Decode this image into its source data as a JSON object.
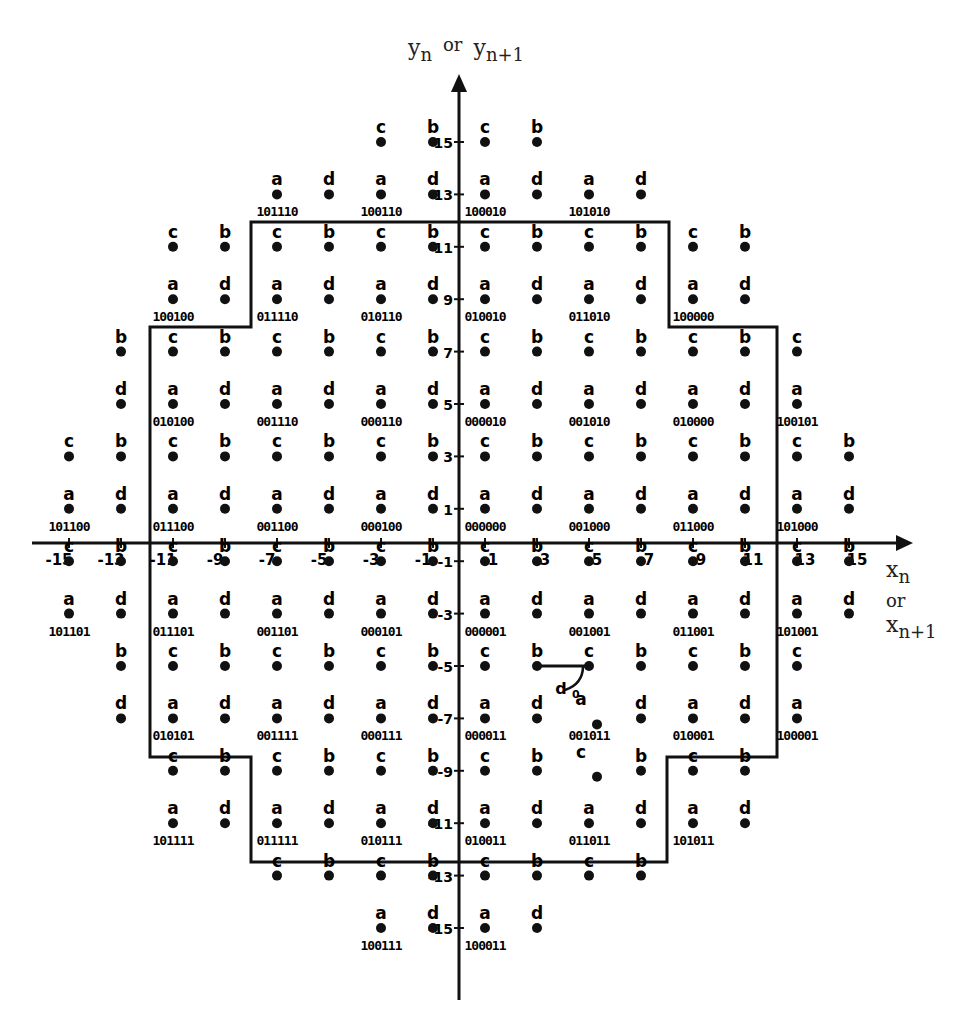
{
  "axes": {
    "y_title": {
      "base": "y",
      "sub": "n",
      "or": "or",
      "sub2": "n+1"
    },
    "x_title": {
      "base": "x",
      "sub": "n",
      "or": "or",
      "sub2": "n+1"
    },
    "x_ticks": [
      -15,
      -13,
      -11,
      -9,
      -7,
      -5,
      -3,
      -1,
      1,
      3,
      5,
      7,
      9,
      11,
      13,
      15
    ],
    "y_ticks": [
      15,
      13,
      11,
      9,
      7,
      5,
      3,
      1,
      -1,
      -3,
      -5,
      -7,
      -9,
      -11,
      -13,
      -15
    ]
  },
  "annotation": {
    "label": "d0",
    "from": [
      3,
      -5
    ],
    "to": [
      5,
      -5
    ]
  },
  "points": [
    {
      "x": -3,
      "y": 15,
      "s": "c"
    },
    {
      "x": -1,
      "y": 15,
      "s": "b"
    },
    {
      "x": 1,
      "y": 15,
      "s": "c"
    },
    {
      "x": 3,
      "y": 15,
      "s": "b"
    },
    {
      "x": -7,
      "y": 13,
      "s": "a",
      "code": "101110"
    },
    {
      "x": -5,
      "y": 13,
      "s": "d"
    },
    {
      "x": -3,
      "y": 13,
      "s": "a",
      "code": "100110"
    },
    {
      "x": -1,
      "y": 13,
      "s": "d"
    },
    {
      "x": 1,
      "y": 13,
      "s": "a",
      "code": "100010"
    },
    {
      "x": 3,
      "y": 13,
      "s": "d"
    },
    {
      "x": 5,
      "y": 13,
      "s": "a",
      "code": "101010"
    },
    {
      "x": 7,
      "y": 13,
      "s": "d"
    },
    {
      "x": -11,
      "y": 11,
      "s": "c"
    },
    {
      "x": -9,
      "y": 11,
      "s": "b"
    },
    {
      "x": -7,
      "y": 11,
      "s": "c"
    },
    {
      "x": -5,
      "y": 11,
      "s": "b"
    },
    {
      "x": -3,
      "y": 11,
      "s": "c"
    },
    {
      "x": -1,
      "y": 11,
      "s": "b"
    },
    {
      "x": 1,
      "y": 11,
      "s": "c"
    },
    {
      "x": 3,
      "y": 11,
      "s": "b"
    },
    {
      "x": 5,
      "y": 11,
      "s": "c"
    },
    {
      "x": 7,
      "y": 11,
      "s": "b"
    },
    {
      "x": 9,
      "y": 11,
      "s": "c"
    },
    {
      "x": 11,
      "y": 11,
      "s": "b"
    },
    {
      "x": -11,
      "y": 9,
      "s": "a",
      "code": "100100"
    },
    {
      "x": -9,
      "y": 9,
      "s": "d"
    },
    {
      "x": -7,
      "y": 9,
      "s": "a",
      "code": "011110"
    },
    {
      "x": -5,
      "y": 9,
      "s": "d"
    },
    {
      "x": -3,
      "y": 9,
      "s": "a",
      "code": "010110"
    },
    {
      "x": -1,
      "y": 9,
      "s": "d"
    },
    {
      "x": 1,
      "y": 9,
      "s": "a",
      "code": "010010"
    },
    {
      "x": 3,
      "y": 9,
      "s": "d"
    },
    {
      "x": 5,
      "y": 9,
      "s": "a",
      "code": "011010"
    },
    {
      "x": 7,
      "y": 9,
      "s": "d"
    },
    {
      "x": 9,
      "y": 9,
      "s": "a",
      "code": "100000"
    },
    {
      "x": 11,
      "y": 9,
      "s": "d"
    },
    {
      "x": -13,
      "y": 7,
      "s": "b"
    },
    {
      "x": -11,
      "y": 7,
      "s": "c"
    },
    {
      "x": -9,
      "y": 7,
      "s": "b"
    },
    {
      "x": -7,
      "y": 7,
      "s": "c"
    },
    {
      "x": -5,
      "y": 7,
      "s": "b"
    },
    {
      "x": -3,
      "y": 7,
      "s": "c"
    },
    {
      "x": -1,
      "y": 7,
      "s": "b"
    },
    {
      "x": 1,
      "y": 7,
      "s": "c"
    },
    {
      "x": 3,
      "y": 7,
      "s": "b"
    },
    {
      "x": 5,
      "y": 7,
      "s": "c"
    },
    {
      "x": 7,
      "y": 7,
      "s": "b"
    },
    {
      "x": 9,
      "y": 7,
      "s": "c"
    },
    {
      "x": 11,
      "y": 7,
      "s": "b"
    },
    {
      "x": 13,
      "y": 7,
      "s": "c"
    },
    {
      "x": -13,
      "y": 5,
      "s": "d"
    },
    {
      "x": -11,
      "y": 5,
      "s": "a",
      "code": "010100"
    },
    {
      "x": -9,
      "y": 5,
      "s": "d"
    },
    {
      "x": -7,
      "y": 5,
      "s": "a",
      "code": "001110"
    },
    {
      "x": -5,
      "y": 5,
      "s": "d"
    },
    {
      "x": -3,
      "y": 5,
      "s": "a",
      "code": "000110"
    },
    {
      "x": -1,
      "y": 5,
      "s": "d"
    },
    {
      "x": 1,
      "y": 5,
      "s": "a",
      "code": "000010"
    },
    {
      "x": 3,
      "y": 5,
      "s": "d"
    },
    {
      "x": 5,
      "y": 5,
      "s": "a",
      "code": "001010"
    },
    {
      "x": 7,
      "y": 5,
      "s": "d"
    },
    {
      "x": 9,
      "y": 5,
      "s": "a",
      "code": "010000"
    },
    {
      "x": 11,
      "y": 5,
      "s": "d"
    },
    {
      "x": 13,
      "y": 5,
      "s": "a",
      "code": "100101"
    },
    {
      "x": -15,
      "y": 3,
      "s": "c"
    },
    {
      "x": -13,
      "y": 3,
      "s": "b"
    },
    {
      "x": -11,
      "y": 3,
      "s": "c"
    },
    {
      "x": -9,
      "y": 3,
      "s": "b"
    },
    {
      "x": -7,
      "y": 3,
      "s": "c"
    },
    {
      "x": -5,
      "y": 3,
      "s": "b"
    },
    {
      "x": -3,
      "y": 3,
      "s": "c"
    },
    {
      "x": -1,
      "y": 3,
      "s": "b"
    },
    {
      "x": 1,
      "y": 3,
      "s": "c"
    },
    {
      "x": 3,
      "y": 3,
      "s": "b"
    },
    {
      "x": 5,
      "y": 3,
      "s": "c"
    },
    {
      "x": 7,
      "y": 3,
      "s": "b"
    },
    {
      "x": 9,
      "y": 3,
      "s": "c"
    },
    {
      "x": 11,
      "y": 3,
      "s": "b"
    },
    {
      "x": 13,
      "y": 3,
      "s": "c"
    },
    {
      "x": 15,
      "y": 3,
      "s": "b"
    },
    {
      "x": -15,
      "y": 1,
      "s": "a",
      "code": "101100"
    },
    {
      "x": -13,
      "y": 1,
      "s": "d"
    },
    {
      "x": -11,
      "y": 1,
      "s": "a",
      "code": "011100"
    },
    {
      "x": -9,
      "y": 1,
      "s": "d"
    },
    {
      "x": -7,
      "y": 1,
      "s": "a",
      "code": "001100"
    },
    {
      "x": -5,
      "y": 1,
      "s": "d"
    },
    {
      "x": -3,
      "y": 1,
      "s": "a",
      "code": "000100"
    },
    {
      "x": -1,
      "y": 1,
      "s": "d"
    },
    {
      "x": 1,
      "y": 1,
      "s": "a",
      "code": "000000"
    },
    {
      "x": 3,
      "y": 1,
      "s": "d"
    },
    {
      "x": 5,
      "y": 1,
      "s": "a",
      "code": "001000"
    },
    {
      "x": 7,
      "y": 1,
      "s": "d"
    },
    {
      "x": 9,
      "y": 1,
      "s": "a",
      "code": "011000"
    },
    {
      "x": 11,
      "y": 1,
      "s": "d"
    },
    {
      "x": 13,
      "y": 1,
      "s": "a",
      "code": "101000"
    },
    {
      "x": 15,
      "y": 1,
      "s": "d"
    },
    {
      "x": -15,
      "y": -1,
      "s": "c"
    },
    {
      "x": -13,
      "y": -1,
      "s": "b"
    },
    {
      "x": -11,
      "y": -1,
      "s": "c"
    },
    {
      "x": -9,
      "y": -1,
      "s": "b"
    },
    {
      "x": -7,
      "y": -1,
      "s": "c"
    },
    {
      "x": -5,
      "y": -1,
      "s": "b"
    },
    {
      "x": -3,
      "y": -1,
      "s": "c"
    },
    {
      "x": -1,
      "y": -1,
      "s": "b"
    },
    {
      "x": 1,
      "y": -1,
      "s": "c"
    },
    {
      "x": 3,
      "y": -1,
      "s": "b"
    },
    {
      "x": 5,
      "y": -1,
      "s": "c"
    },
    {
      "x": 7,
      "y": -1,
      "s": "b"
    },
    {
      "x": 9,
      "y": -1,
      "s": "c"
    },
    {
      "x": 11,
      "y": -1,
      "s": "b"
    },
    {
      "x": 13,
      "y": -1,
      "s": "c"
    },
    {
      "x": 15,
      "y": -1,
      "s": "b"
    },
    {
      "x": -15,
      "y": -3,
      "s": "a",
      "code": "101101"
    },
    {
      "x": -13,
      "y": -3,
      "s": "d"
    },
    {
      "x": -11,
      "y": -3,
      "s": "a",
      "code": "011101"
    },
    {
      "x": -9,
      "y": -3,
      "s": "d"
    },
    {
      "x": -7,
      "y": -3,
      "s": "a",
      "code": "001101"
    },
    {
      "x": -5,
      "y": -3,
      "s": "d"
    },
    {
      "x": -3,
      "y": -3,
      "s": "a",
      "code": "000101"
    },
    {
      "x": -1,
      "y": -3,
      "s": "d"
    },
    {
      "x": 1,
      "y": -3,
      "s": "a",
      "code": "000001"
    },
    {
      "x": 3,
      "y": -3,
      "s": "d"
    },
    {
      "x": 5,
      "y": -3,
      "s": "a",
      "code": "001001"
    },
    {
      "x": 7,
      "y": -3,
      "s": "d"
    },
    {
      "x": 9,
      "y": -3,
      "s": "a",
      "code": "011001"
    },
    {
      "x": 11,
      "y": -3,
      "s": "d"
    },
    {
      "x": 13,
      "y": -3,
      "s": "a",
      "code": "101001"
    },
    {
      "x": 15,
      "y": -3,
      "s": "d"
    },
    {
      "x": -13,
      "y": -5,
      "s": "b"
    },
    {
      "x": -11,
      "y": -5,
      "s": "c"
    },
    {
      "x": -9,
      "y": -5,
      "s": "b"
    },
    {
      "x": -7,
      "y": -5,
      "s": "c"
    },
    {
      "x": -5,
      "y": -5,
      "s": "b"
    },
    {
      "x": -3,
      "y": -5,
      "s": "c"
    },
    {
      "x": -1,
      "y": -5,
      "s": "b"
    },
    {
      "x": 1,
      "y": -5,
      "s": "c"
    },
    {
      "x": 3,
      "y": -5,
      "s": "b"
    },
    {
      "x": 5,
      "y": -5,
      "s": "c"
    },
    {
      "x": 7,
      "y": -5,
      "s": "b"
    },
    {
      "x": 9,
      "y": -5,
      "s": "c"
    },
    {
      "x": 11,
      "y": -5,
      "s": "b"
    },
    {
      "x": 13,
      "y": -5,
      "s": "c"
    },
    {
      "x": -13,
      "y": -7,
      "s": "d"
    },
    {
      "x": -11,
      "y": -7,
      "s": "a",
      "code": "010101"
    },
    {
      "x": -9,
      "y": -7,
      "s": "d"
    },
    {
      "x": -7,
      "y": -7,
      "s": "a",
      "code": "001111"
    },
    {
      "x": -5,
      "y": -7,
      "s": "d"
    },
    {
      "x": -3,
      "y": -7,
      "s": "a",
      "code": "000111"
    },
    {
      "x": -1,
      "y": -7,
      "s": "d"
    },
    {
      "x": 1,
      "y": -7,
      "s": "a",
      "code": "000011"
    },
    {
      "x": 3,
      "y": -7,
      "s": "d"
    },
    {
      "x": 5,
      "y": -7,
      "s": "a",
      "code": "001011",
      "offset": true
    },
    {
      "x": 7,
      "y": -7,
      "s": "d"
    },
    {
      "x": 9,
      "y": -7,
      "s": "a",
      "code": "010001"
    },
    {
      "x": 11,
      "y": -7,
      "s": "d"
    },
    {
      "x": 13,
      "y": -7,
      "s": "a",
      "code": "100001"
    },
    {
      "x": -11,
      "y": -9,
      "s": "c"
    },
    {
      "x": -9,
      "y": -9,
      "s": "b"
    },
    {
      "x": -7,
      "y": -9,
      "s": "c"
    },
    {
      "x": -5,
      "y": -9,
      "s": "b"
    },
    {
      "x": -3,
      "y": -9,
      "s": "c"
    },
    {
      "x": -1,
      "y": -9,
      "s": "b"
    },
    {
      "x": 1,
      "y": -9,
      "s": "c"
    },
    {
      "x": 3,
      "y": -9,
      "s": "b"
    },
    {
      "x": 5,
      "y": -9,
      "s": "c",
      "offset": true
    },
    {
      "x": 7,
      "y": -9,
      "s": "b"
    },
    {
      "x": 9,
      "y": -9,
      "s": "c"
    },
    {
      "x": 11,
      "y": -9,
      "s": "b"
    },
    {
      "x": -11,
      "y": -11,
      "s": "a",
      "code": "101111"
    },
    {
      "x": -9,
      "y": -11,
      "s": "d"
    },
    {
      "x": -7,
      "y": -11,
      "s": "a",
      "code": "011111"
    },
    {
      "x": -5,
      "y": -11,
      "s": "d"
    },
    {
      "x": -3,
      "y": -11,
      "s": "a",
      "code": "010111"
    },
    {
      "x": -1,
      "y": -11,
      "s": "d"
    },
    {
      "x": 1,
      "y": -11,
      "s": "a",
      "code": "010011"
    },
    {
      "x": 3,
      "y": -11,
      "s": "d"
    },
    {
      "x": 5,
      "y": -11,
      "s": "a",
      "code": "011011"
    },
    {
      "x": 7,
      "y": -11,
      "s": "d"
    },
    {
      "x": 9,
      "y": -11,
      "s": "a",
      "code": "101011"
    },
    {
      "x": 11,
      "y": -11,
      "s": "d"
    },
    {
      "x": -7,
      "y": -13,
      "s": "c"
    },
    {
      "x": -5,
      "y": -13,
      "s": "b"
    },
    {
      "x": -3,
      "y": -13,
      "s": "c"
    },
    {
      "x": -1,
      "y": -13,
      "s": "b"
    },
    {
      "x": 1,
      "y": -13,
      "s": "c"
    },
    {
      "x": 3,
      "y": -13,
      "s": "b"
    },
    {
      "x": 5,
      "y": -13,
      "s": "c"
    },
    {
      "x": 7,
      "y": -13,
      "s": "b"
    },
    {
      "x": -3,
      "y": -15,
      "s": "a",
      "code": "100111"
    },
    {
      "x": -1,
      "y": -15,
      "s": "d"
    },
    {
      "x": 1,
      "y": -15,
      "s": "a",
      "code": "100011"
    },
    {
      "x": 3,
      "y": -15,
      "s": "d"
    }
  ],
  "boundary": [
    [
      251,
      222
    ],
    [
      669,
      222
    ],
    [
      669,
      327
    ],
    [
      777,
      327
    ],
    [
      777,
      757
    ],
    [
      667,
      757
    ],
    [
      667,
      862
    ],
    [
      251,
      862
    ],
    [
      251,
      757
    ],
    [
      150,
      757
    ],
    [
      150,
      327
    ],
    [
      251,
      327
    ]
  ]
}
